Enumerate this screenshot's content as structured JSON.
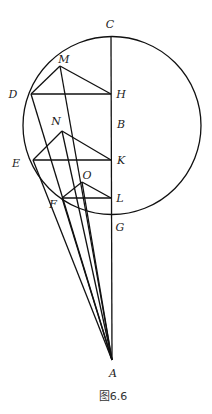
{
  "diagram": {
    "caption": "图6.6",
    "circle": {
      "cx": 112,
      "cy": 125.5,
      "r": 89
    },
    "points": {
      "C": {
        "x": 111,
        "y": 37,
        "label": "C",
        "lx": 110,
        "ly": 28
      },
      "H": {
        "x": 111,
        "y": 94,
        "label": "H",
        "lx": 121,
        "ly": 98
      },
      "B": {
        "x": 111,
        "y": 127,
        "label": "B",
        "lx": 121,
        "ly": 128
      },
      "K": {
        "x": 111,
        "y": 160,
        "label": "K",
        "lx": 121,
        "ly": 164
      },
      "L": {
        "x": 111,
        "y": 198,
        "label": "L",
        "lx": 120,
        "ly": 202
      },
      "G": {
        "x": 111,
        "y": 214,
        "label": "G",
        "lx": 120,
        "ly": 231
      },
      "A": {
        "x": 112,
        "y": 360,
        "label": "A",
        "lx": 113,
        "ly": 377
      },
      "D": {
        "x": 31,
        "y": 94,
        "label": "D",
        "lx": 13,
        "ly": 98
      },
      "M": {
        "x": 60,
        "y": 66,
        "label": "M",
        "lx": 64,
        "ly": 63
      },
      "E": {
        "x": 33,
        "y": 160,
        "label": "E",
        "lx": 16,
        "ly": 167
      },
      "N": {
        "x": 62,
        "y": 131,
        "label": "N",
        "lx": 56,
        "ly": 125
      },
      "F": {
        "x": 62,
        "y": 198,
        "label": "F",
        "lx": 53,
        "ly": 208
      },
      "O": {
        "x": 82,
        "y": 182,
        "label": "O",
        "lx": 87,
        "ly": 179
      }
    },
    "segments": [
      [
        "C",
        "A"
      ],
      [
        "D",
        "H"
      ],
      [
        "D",
        "M"
      ],
      [
        "M",
        "H"
      ],
      [
        "E",
        "K"
      ],
      [
        "E",
        "N"
      ],
      [
        "N",
        "K"
      ],
      [
        "F",
        "L"
      ],
      [
        "F",
        "O"
      ],
      [
        "O",
        "L"
      ],
      [
        "D",
        "A"
      ],
      [
        "M",
        "A"
      ],
      [
        "E",
        "A"
      ],
      [
        "N",
        "A"
      ],
      [
        "F",
        "A"
      ],
      [
        "O",
        "A"
      ]
    ]
  }
}
